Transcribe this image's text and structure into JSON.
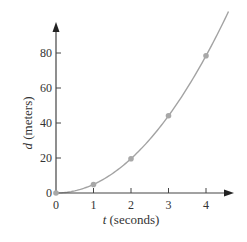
{
  "chart_data": {
    "type": "line",
    "title": "",
    "xlabel_var": "t",
    "xlabel_unit": "(seconds)",
    "xlabel": "t (seconds)",
    "ylabel_var": "d",
    "ylabel_unit": "(meters)",
    "ylabel": "d (meters)",
    "x_ticks": [
      "0",
      "1",
      "2",
      "3",
      "4"
    ],
    "y_ticks": [
      "0",
      "20",
      "40",
      "60",
      "80"
    ],
    "xlim": [
      0,
      4.7
    ],
    "ylim": [
      0,
      100
    ],
    "grid": false,
    "legend": null,
    "series": [
      {
        "name": "d = 4.9 t^2",
        "x": [
          0,
          1,
          2,
          3,
          4
        ],
        "values": [
          0,
          4.9,
          19.6,
          44.1,
          78.4
        ],
        "markers": true,
        "curve": "quadratic fit extending to t≈4.6"
      }
    ],
    "colors": {
      "axis": "#444444",
      "curve": "#a3a3a3",
      "marker": "#a8a8a8"
    }
  }
}
